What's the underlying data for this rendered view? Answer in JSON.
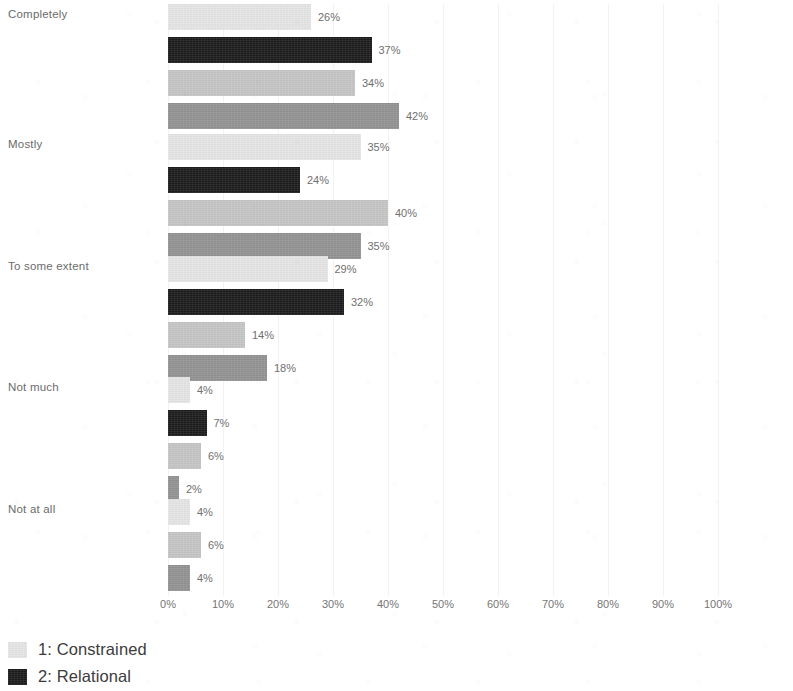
{
  "chart_data": {
    "type": "bar",
    "orientation": "horizontal",
    "title": "",
    "subtitle": "",
    "xlabel": "",
    "ylabel": "",
    "xlim": [
      0,
      100
    ],
    "grid": true,
    "legend_position": "bottom-left",
    "categories": [
      "Completely",
      "Mostly",
      "To some extent",
      "Not much",
      "Not at all"
    ],
    "tick_labels": [
      "0%",
      "10%",
      "20%",
      "30%",
      "40%",
      "50%",
      "60%",
      "70%",
      "80%",
      "90%",
      "100%"
    ],
    "tick_values": [
      0,
      10,
      20,
      30,
      40,
      50,
      60,
      70,
      80,
      90,
      100
    ],
    "series": [
      {
        "name": "1: Constrained",
        "color": "#e6e6e6",
        "values": [
          26,
          35,
          29,
          4,
          4
        ],
        "labels": [
          "26%",
          "35%",
          "29%",
          "4%",
          "4%"
        ]
      },
      {
        "name": "2: Relational",
        "color": "#1c1c1c",
        "values": [
          37,
          24,
          32,
          7,
          null
        ],
        "labels": [
          "37%",
          "24%",
          "32%",
          "7%",
          ""
        ]
      },
      {
        "name": "3",
        "color": "#c6c6c6",
        "values": [
          34,
          40,
          14,
          6,
          6
        ],
        "labels": [
          "34%",
          "40%",
          "14%",
          "6%",
          "6%"
        ]
      },
      {
        "name": "4",
        "color": "#939393",
        "values": [
          42,
          35,
          18,
          2,
          4
        ],
        "labels": [
          "42%",
          "35%",
          "18%",
          "2%",
          "4%"
        ]
      }
    ],
    "groups": [
      {
        "category": "Completely",
        "bars": [
          {
            "series": "1: Constrained",
            "value": 26,
            "label": "26%",
            "color": "#e6e6e6"
          },
          {
            "series": "2: Relational",
            "value": 37,
            "label": "37%",
            "color": "#1c1c1c"
          },
          {
            "series": "3",
            "value": 34,
            "label": "34%",
            "color": "#c6c6c6"
          },
          {
            "series": "4",
            "value": 42,
            "label": "42%",
            "color": "#939393"
          }
        ]
      },
      {
        "category": "Mostly",
        "bars": [
          {
            "series": "1: Constrained",
            "value": 35,
            "label": "35%",
            "color": "#e6e6e6"
          },
          {
            "series": "2: Relational",
            "value": 24,
            "label": "24%",
            "color": "#1c1c1c"
          },
          {
            "series": "3",
            "value": 40,
            "label": "40%",
            "color": "#c6c6c6"
          },
          {
            "series": "4",
            "value": 35,
            "label": "35%",
            "color": "#939393"
          }
        ]
      },
      {
        "category": "To some extent",
        "bars": [
          {
            "series": "1: Constrained",
            "value": 29,
            "label": "29%",
            "color": "#e6e6e6"
          },
          {
            "series": "2: Relational",
            "value": 32,
            "label": "32%",
            "color": "#1c1c1c"
          },
          {
            "series": "3",
            "value": 14,
            "label": "14%",
            "color": "#c6c6c6"
          },
          {
            "series": "4",
            "value": 18,
            "label": "18%",
            "color": "#939393"
          }
        ]
      },
      {
        "category": "Not much",
        "bars": [
          {
            "series": "1: Constrained",
            "value": 4,
            "label": "4%",
            "color": "#e6e6e6"
          },
          {
            "series": "2: Relational",
            "value": 7,
            "label": "7%",
            "color": "#1c1c1c"
          },
          {
            "series": "3",
            "value": 6,
            "label": "6%",
            "color": "#c6c6c6"
          },
          {
            "series": "4",
            "value": 2,
            "label": "2%",
            "color": "#939393"
          }
        ]
      },
      {
        "category": "Not at all",
        "bars": [
          {
            "series": "1: Constrained",
            "value": 4,
            "label": "4%",
            "color": "#e6e6e6"
          },
          {
            "series": "3",
            "value": 6,
            "label": "6%",
            "color": "#c6c6c6"
          },
          {
            "series": "4",
            "value": 4,
            "label": "4%",
            "color": "#939393"
          }
        ]
      }
    ]
  },
  "legend": {
    "items": [
      {
        "label": "1: Constrained",
        "color": "#e6e6e6"
      },
      {
        "label": "2: Relational",
        "color": "#1c1c1c"
      }
    ]
  },
  "axis": {
    "x_origin_px": 168,
    "px_per_percent": 5.5
  }
}
